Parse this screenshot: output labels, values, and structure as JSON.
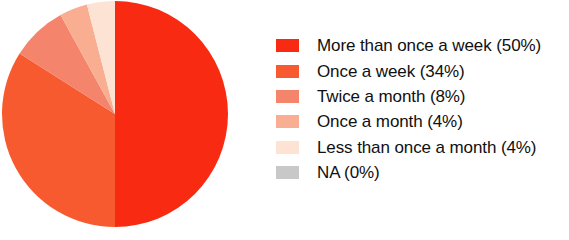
{
  "chart_data": {
    "type": "pie",
    "title": "",
    "categories": [
      "More than once a week",
      "Once a week",
      "Twice a month",
      "Once a month",
      "Less than once a month",
      "NA"
    ],
    "values": [
      50,
      34,
      8,
      4,
      4,
      0
    ],
    "value_unit": "%",
    "colors": [
      "#F82B12",
      "#F85A30",
      "#F4846B",
      "#F9AE92",
      "#FCE3D3",
      "#C8C8C8"
    ],
    "legend_position": "right",
    "grid": false,
    "start_angle_deg": 0,
    "direction": "clockwise",
    "legend": [
      {
        "label": "More than once a week (50%)",
        "color": "#F82B12",
        "value": 50,
        "name": "More than once a week"
      },
      {
        "label": "Once a week (34%)",
        "color": "#F85A30",
        "value": 34,
        "name": "Once a week"
      },
      {
        "label": "Twice a month (8%)",
        "color": "#F4846B",
        "value": 8,
        "name": "Twice a month"
      },
      {
        "label": "Once a month (4%)",
        "color": "#F9AE92",
        "value": 4,
        "name": "Once a month"
      },
      {
        "label": "Less than once a month (4%)",
        "color": "#FCE3D3",
        "value": 4,
        "name": "Less than once a month"
      },
      {
        "label": "NA (0%)",
        "color": "#C8C8C8",
        "value": 0,
        "name": "NA"
      }
    ],
    "geometry": {
      "cx": 115,
      "cy": 114,
      "r": 113
    }
  }
}
